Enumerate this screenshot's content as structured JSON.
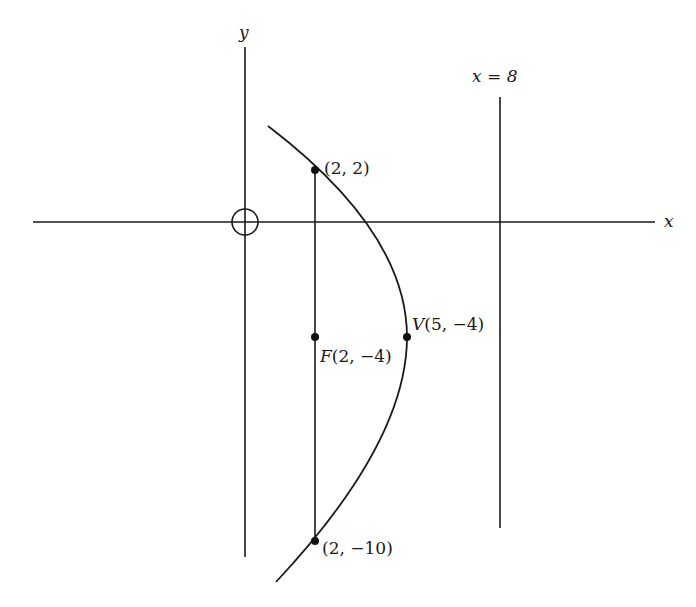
{
  "figure": {
    "axes": {
      "x_label": "x",
      "y_label": "y",
      "origin_marker": "circle-crosshair"
    },
    "directrix": {
      "label": "x = 8",
      "equation": "x = 8"
    },
    "points": [
      {
        "id": "latus-top",
        "label": "(2, 2)",
        "x": 2,
        "y": 2
      },
      {
        "id": "focus",
        "label": "F(2, −4)",
        "name": "F",
        "coords": "(2, −4)",
        "x": 2,
        "y": -4
      },
      {
        "id": "vertex",
        "label": "V(5, −4)",
        "name": "V",
        "coords": "(5, −4)",
        "x": 5,
        "y": -4
      },
      {
        "id": "latus-bottom",
        "label": "(2, −10)",
        "x": 2,
        "y": -10
      }
    ],
    "parabola": {
      "equation": "(y + 4)^2 = -12(x - 5)",
      "opens": "left"
    }
  },
  "labels": {
    "x_axis": "x",
    "y_axis": "y",
    "directrix": "x = 8",
    "latus_top": "(2, 2)",
    "focus_name": "F",
    "focus_coords": "(2, −4)",
    "vertex_name": "V",
    "vertex_coords": "(5, −4)",
    "latus_bottom": "(2, −10)"
  },
  "colors": {
    "ink": "#1a1a1a",
    "background": "#ffffff"
  }
}
